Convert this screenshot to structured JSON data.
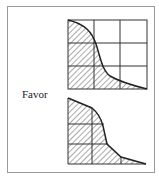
{
  "figure": {
    "label": "Favor",
    "colors": {
      "line": "#333333",
      "hatch": "#555555",
      "frame": "#9a9a9a"
    },
    "panels": [
      {
        "name": "top",
        "grid": "3x3",
        "description": "hatched area under convex-concave decreasing curve"
      },
      {
        "name": "bottom",
        "grid": "3x3 partial",
        "description": "hatched area under decreasing curve, grid inside hatched region"
      }
    ]
  }
}
